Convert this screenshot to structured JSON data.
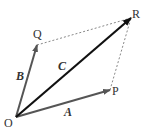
{
  "diagram": {
    "type": "vector-parallelogram",
    "points": {
      "O": {
        "label": "O",
        "x": 16,
        "y": 117
      },
      "P": {
        "label": "P",
        "x": 110,
        "y": 90
      },
      "Q": {
        "label": "Q",
        "x": 37,
        "y": 45
      },
      "R": {
        "label": "R",
        "x": 131,
        "y": 18
      }
    },
    "vectors": [
      {
        "name": "A",
        "label": "A",
        "from": "O",
        "to": "P",
        "color": "#555555"
      },
      {
        "name": "B",
        "label": "B",
        "from": "O",
        "to": "Q",
        "color": "#555555"
      },
      {
        "name": "C",
        "label": "C",
        "from": "O",
        "to": "R",
        "color": "#111111"
      }
    ],
    "dashed_edges": [
      {
        "from": "Q",
        "to": "R"
      },
      {
        "from": "P",
        "to": "R"
      }
    ],
    "colors": {
      "vector_gray": "#555555",
      "resultant": "#111111",
      "dashed": "#888888",
      "text": "#333333"
    }
  }
}
